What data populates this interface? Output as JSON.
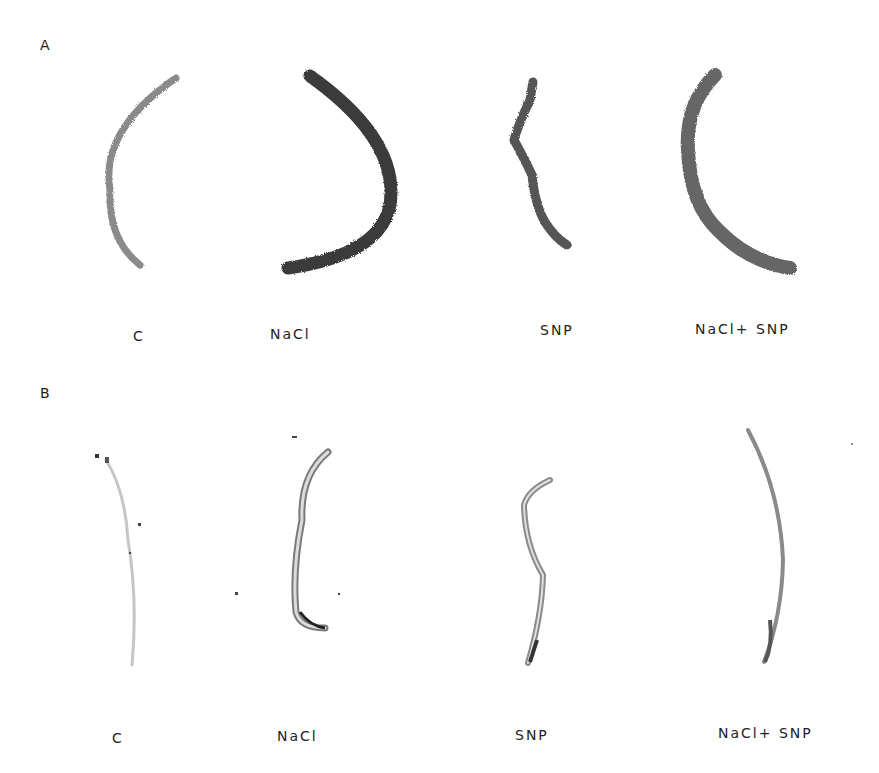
{
  "figure": {
    "panels": [
      {
        "label": "A",
        "samples": [
          {
            "caption": "C"
          },
          {
            "caption": "NaCl"
          },
          {
            "caption": "SNP"
          },
          {
            "caption": "NaCl+ SNP"
          }
        ]
      },
      {
        "label": "B",
        "samples": [
          {
            "caption": "C"
          },
          {
            "caption": "NaCl"
          },
          {
            "caption": "SNP"
          },
          {
            "caption": "NaCl+ SNP"
          }
        ]
      }
    ]
  }
}
